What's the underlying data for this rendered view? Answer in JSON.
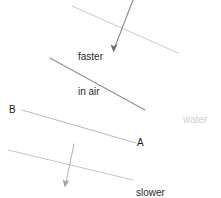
{
  "diagram": {
    "width": 221,
    "height": 198,
    "background": "#ffffff",
    "colors": {
      "wavefront_light": "#c9c9c9",
      "wavefront_mid": "#8f8f8f",
      "ray": "#8a8a8a",
      "text_dark": "#2b2b2b",
      "text_point": "#1c1c1c",
      "text_medium": "#cfcfcf"
    },
    "labels": {
      "faster_line1": "faster",
      "faster_line2": "in air",
      "slower_line1": "slower",
      "slower_line2": "in water",
      "point_b": "B",
      "point_a": "A",
      "medium_water": "water"
    },
    "wavefronts": [
      {
        "name": "wavefront-air-1",
        "x1": 72,
        "y1": 6,
        "x2": 178,
        "y2": 53,
        "color": "#c9c9c9",
        "width": 1
      },
      {
        "name": "wavefront-air-2",
        "x1": 50,
        "y1": 58,
        "x2": 145,
        "y2": 110,
        "color": "#8f8f8f",
        "width": 1.1
      },
      {
        "name": "wavefront-boundary-ba",
        "x1": 22,
        "y1": 110,
        "x2": 136,
        "y2": 143,
        "color": "#b9b9b9",
        "width": 1
      },
      {
        "name": "wavefront-water-1",
        "x1": 8,
        "y1": 150,
        "x2": 133,
        "y2": 180,
        "color": "#c4c4c4",
        "width": 1
      }
    ],
    "rays": [
      {
        "name": "incident-ray",
        "x1": 133,
        "y1": 0,
        "x2": 114,
        "y2": 50,
        "color": "#8a8a8a",
        "width": 1.1,
        "arrowhead": true,
        "description": "incident ray travelling faster in air"
      },
      {
        "name": "refracted-ray",
        "x1": 74,
        "y1": 144,
        "x2": 65,
        "y2": 186,
        "color": "#b0b0b0",
        "width": 1,
        "arrowhead": true,
        "description": "refracted ray travelling slower in water"
      }
    ]
  }
}
